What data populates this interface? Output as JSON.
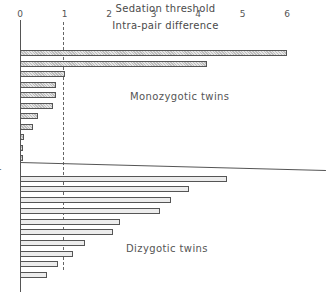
{
  "header": {
    "title": "Sedation threshold",
    "subtitle": "Intra-pair difference"
  },
  "labels": {
    "group_mz": "Monozygotic twins",
    "group_dz": "Dizygotic twins",
    "ylabel": "Twin pairs"
  },
  "ticks": [
    "0",
    "1",
    "2",
    "3",
    "4",
    "5",
    "6"
  ],
  "chart_data": {
    "type": "bar",
    "orientation": "horizontal",
    "title": "Sedation threshold",
    "subtitle": "Intra-pair difference",
    "xlabel": "Intra-pair difference",
    "ylabel": "Twin pairs",
    "xlim": [
      0,
      6
    ],
    "x_ticks": [
      0,
      1,
      2,
      3,
      4,
      5,
      6
    ],
    "x_axis_position": "top",
    "reference_line": {
      "x": 1,
      "style": "dashed"
    },
    "grid": false,
    "series": [
      {
        "name": "Monozygotic twins",
        "fill": "hatched",
        "values": [
          6.0,
          4.2,
          1.0,
          0.8,
          0.8,
          0.75,
          0.4,
          0.3,
          0.1,
          0.05,
          0.0
        ]
      },
      {
        "name": "Dizygotic twins",
        "fill": "light",
        "values": [
          6.9,
          4.65,
          3.8,
          3.4,
          3.15,
          2.25,
          2.1,
          1.45,
          1.2,
          0.85,
          0.6
        ],
        "notes": "first value exceeds axis range (drawn as line past 6)"
      }
    ]
  }
}
